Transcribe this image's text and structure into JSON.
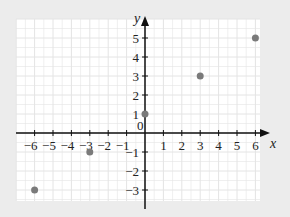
{
  "chart_data": {
    "type": "scatter",
    "title": "",
    "xlabel": "x",
    "ylabel": "y",
    "xlim": [
      -6.6,
      6.6
    ],
    "ylim": [
      -3.6,
      5.6
    ],
    "x_ticks": [
      -6,
      -5,
      -4,
      -3,
      -2,
      -1,
      1,
      2,
      3,
      4,
      5,
      6
    ],
    "y_ticks": [
      -3,
      -2,
      -1,
      1,
      2,
      3,
      4,
      5
    ],
    "origin_label": "0",
    "grid": true,
    "legend": null,
    "series": [
      {
        "name": "points",
        "color": "#7a7a7a",
        "points": [
          {
            "x": -6,
            "y": -3
          },
          {
            "x": -3,
            "y": -1
          },
          {
            "x": 0,
            "y": 1
          },
          {
            "x": 3,
            "y": 3
          },
          {
            "x": 6,
            "y": 5
          }
        ]
      }
    ]
  },
  "colors": {
    "background": "#ececec",
    "plot_background": "#ffffff",
    "grid": "#e4e4e4",
    "axis": "#111111",
    "point": "#7a7a7a"
  }
}
